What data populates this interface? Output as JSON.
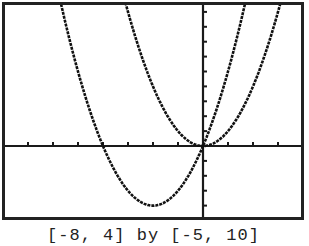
{
  "chart_data": {
    "type": "line",
    "title": "",
    "caption": "[-8, 4] by [-5, 10]",
    "xlabel": "",
    "ylabel": "",
    "xlim": [
      -8,
      4
    ],
    "ylim": [
      -5,
      10
    ],
    "xscl": 1,
    "yscl": 1,
    "grid": false,
    "axes": true,
    "legend": null,
    "series": [
      {
        "name": "y = x^2",
        "expr": "x^2",
        "x": [
          -3.2,
          -3,
          -2.5,
          -2,
          -1.5,
          -1,
          -0.5,
          0,
          0.5,
          1,
          1.5,
          2,
          2.5,
          3,
          3.2
        ],
        "values": [
          10.24,
          9,
          6.25,
          4,
          2.25,
          1,
          0.25,
          0,
          0.25,
          1,
          2.25,
          4,
          6.25,
          9,
          10.24
        ]
      },
      {
        "name": "y = x^2 + 4x",
        "expr": "x^2+4*x",
        "x": [
          -5.8,
          -5.5,
          -5,
          -4.5,
          -4,
          -3.5,
          -3,
          -2.5,
          -2,
          -1.5,
          -1,
          -0.5,
          0,
          0.5,
          1,
          1.5,
          1.8
        ],
        "values": [
          10.44,
          8.25,
          5,
          2.25,
          0,
          -1.75,
          -3,
          -3.75,
          -4,
          -3.75,
          -3,
          -1.75,
          0,
          2.25,
          5,
          8.25,
          10.44
        ]
      }
    ]
  },
  "style": {
    "frame_color": "#222222",
    "axis_color": "#1a1a1a",
    "curve_color": "#111111",
    "background": "#ffffff"
  },
  "caption_text": "[-8, 4] by [-5, 10]"
}
